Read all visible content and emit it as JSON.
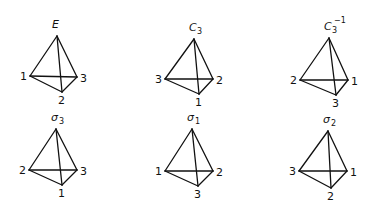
{
  "figure": {
    "panels": [
      {
        "op_main": "E",
        "op_sub": "",
        "op_sup": "",
        "left": "1",
        "right": "3",
        "bottom": "2",
        "apex": [
          57,
          36
        ],
        "lv": [
          30,
          76
        ],
        "rv": [
          77,
          77
        ],
        "bv": [
          62,
          92
        ]
      },
      {
        "op_main": "C",
        "op_sub": "3",
        "op_sup": "",
        "left": "3",
        "right": "2",
        "bottom": "1",
        "apex": [
          194,
          39
        ],
        "lv": [
          165,
          79
        ],
        "rv": [
          213,
          79
        ],
        "bv": [
          199,
          94
        ]
      },
      {
        "op_main": "C",
        "op_sub": "3",
        "op_sup": "−1",
        "left": "2",
        "right": "1",
        "bottom": "3",
        "apex": [
          329,
          38
        ],
        "lv": [
          300,
          80
        ],
        "rv": [
          348,
          80
        ],
        "bv": [
          336,
          95
        ]
      },
      {
        "op_main": "σ",
        "op_sub": "3",
        "op_sup": "",
        "left": "2",
        "right": "3",
        "bottom": "1",
        "apex": [
          56,
          129
        ],
        "lv": [
          29,
          170
        ],
        "rv": [
          77,
          170
        ],
        "bv": [
          62,
          185
        ]
      },
      {
        "op_main": "σ",
        "op_sub": "1",
        "op_sup": "",
        "left": "1",
        "right": "2",
        "bottom": "3",
        "apex": [
          192,
          129
        ],
        "lv": [
          165,
          171
        ],
        "rv": [
          213,
          171
        ],
        "bv": [
          198,
          186
        ]
      },
      {
        "op_main": "σ",
        "op_sub": "2",
        "op_sup": "",
        "left": "3",
        "right": "1",
        "bottom": "2",
        "apex": [
          328,
          131
        ],
        "lv": [
          299,
          171
        ],
        "rv": [
          347,
          171
        ],
        "bv": [
          331,
          188
        ]
      }
    ]
  }
}
